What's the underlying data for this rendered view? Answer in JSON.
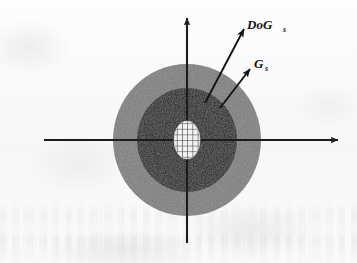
{
  "figure": {
    "name": "dog-gaussian-scale-diagram",
    "background_color": "#fbfbfb",
    "axes": {
      "x_axis_name": "horizontal-axis",
      "y_axis_name": "vertical-axis",
      "color": "#1c1c1c",
      "origin_x": 187,
      "origin_y": 140
    },
    "regions": {
      "outer_disk": {
        "label": "outer-gaussian-disk",
        "color": "#7d7d7d",
        "center_x": 187,
        "center_y": 140,
        "radius_x": 74,
        "radius_y": 76
      },
      "inner_disk": {
        "label": "inner-dog-disk",
        "color": "#111111",
        "center_x": 187,
        "center_y": 140,
        "radius_x": 50,
        "radius_y": 52
      },
      "core_patch": {
        "label": "grid-hatched-core",
        "fill_color": "#f2f2f2",
        "grid_color": "#3a3a3a",
        "center_x": 187,
        "center_y": 140,
        "radius_x": 13,
        "radius_y": 19
      }
    },
    "vectors": [
      {
        "id": "dog-vector",
        "label_main": "DoG",
        "label_sub": "s",
        "x1": 205,
        "y1": 103,
        "x2": 244,
        "y2": 29,
        "label_x": 247,
        "label_y": 29,
        "color": "#141414"
      },
      {
        "id": "gaussian-vector",
        "label_main": "G",
        "label_sub": "s",
        "x1": 220,
        "y1": 108,
        "x2": 250,
        "y2": 69,
        "label_x": 254,
        "label_y": 68,
        "color": "#141414"
      }
    ]
  }
}
